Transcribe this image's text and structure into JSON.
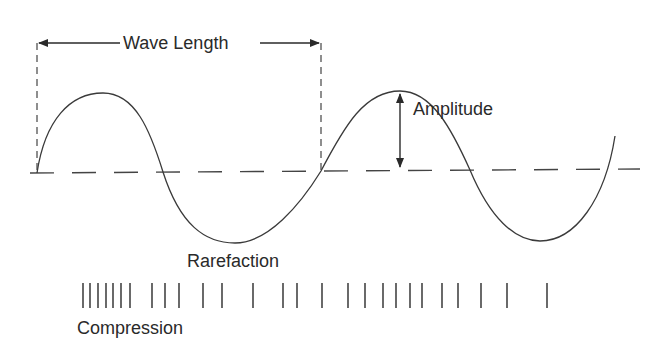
{
  "diagram": {
    "labels": {
      "wave_length": "Wave Length",
      "amplitude": "Amplitude",
      "rarefaction": "Rarefaction",
      "compression": "Compression"
    },
    "colors": {
      "stroke": "#333333",
      "text": "#2a2a2a",
      "background": "#ffffff"
    },
    "compression_lines_x": [
      83,
      90,
      98,
      106,
      113,
      121,
      130,
      152,
      165,
      179,
      203,
      222,
      253,
      283,
      297,
      322,
      348,
      365,
      383,
      396,
      410,
      422,
      442,
      458,
      481,
      507,
      547
    ]
  }
}
